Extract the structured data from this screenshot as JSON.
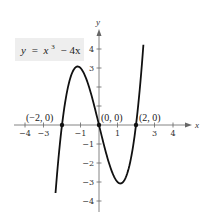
{
  "chart_data": {
    "type": "line",
    "title": "",
    "equation_label": {
      "lhs": "y",
      "equals": "=",
      "base": "x",
      "exponent": "3",
      "rest": "− 4x",
      "box_fill": "#eeeeee"
    },
    "xlabel": "x",
    "ylabel": "y",
    "xlim": [
      -4.5,
      4.9
    ],
    "ylim": [
      -4.6,
      4.9
    ],
    "grid": false,
    "legend": "none",
    "x_ticks": [
      {
        "value": -4,
        "label": "−4"
      },
      {
        "value": -3,
        "label": "−3"
      },
      {
        "value": -1,
        "label": "−1"
      },
      {
        "value": 1,
        "label": "1"
      },
      {
        "value": 3,
        "label": "3"
      },
      {
        "value": 4,
        "label": "4"
      }
    ],
    "y_ticks": [
      {
        "value": 4,
        "label": "4"
      },
      {
        "value": 3,
        "label": "3"
      },
      {
        "value": 2,
        "label": ""
      },
      {
        "value": 1,
        "label": ""
      },
      {
        "value": -1,
        "label": "−1"
      },
      {
        "value": -2,
        "label": "−2"
      },
      {
        "value": -3,
        "label": "−3"
      },
      {
        "value": -4,
        "label": "−4"
      }
    ],
    "series": [
      {
        "name": "y = x^3 − 4x",
        "function": "x^3 - 4x",
        "x_range": [
          -2.35,
          2.4
        ],
        "color": "#111111",
        "x": [
          -2.35,
          -2.2,
          -2.0,
          -1.8,
          -1.6,
          -1.4,
          -1.2,
          -1.1547,
          -1.0,
          -0.8,
          -0.6,
          -0.4,
          -0.2,
          0.0,
          0.2,
          0.4,
          0.6,
          0.8,
          1.0,
          1.1547,
          1.2,
          1.4,
          1.6,
          1.8,
          2.0,
          2.2,
          2.4
        ],
        "y": [
          -3.58,
          -1.85,
          0.0,
          1.37,
          2.3,
          2.86,
          3.07,
          3.08,
          3.0,
          2.69,
          2.18,
          1.54,
          0.79,
          0.0,
          -0.79,
          -1.54,
          -2.18,
          -2.69,
          -3.0,
          -3.08,
          -3.07,
          -2.86,
          -2.3,
          -1.37,
          0.0,
          1.85,
          4.22
        ]
      }
    ],
    "points": [
      {
        "x": -2,
        "y": 0,
        "label": "(−2, 0)"
      },
      {
        "x": 0,
        "y": 0,
        "label": "(0, 0)"
      },
      {
        "x": 2,
        "y": 0,
        "label": "(2, 0)"
      }
    ]
  }
}
